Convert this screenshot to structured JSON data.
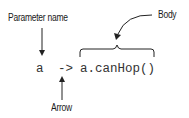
{
  "diagram": {
    "labels": {
      "parameter_name": "Parameter name",
      "body": "Body",
      "arrow": "Arrow"
    },
    "code": {
      "parameter": "a",
      "arrow_token": "->",
      "body": "a.canHop()"
    },
    "colors": {
      "text": "#1a1a1a",
      "code": "#333333",
      "lines": "#222222"
    }
  }
}
